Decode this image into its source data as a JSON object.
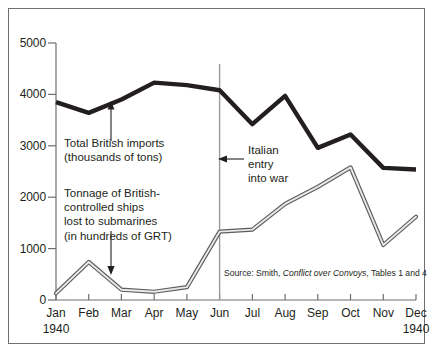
{
  "chart_data": {
    "type": "line",
    "title": "",
    "subtitle": "",
    "xlabel": "",
    "ylabel": "",
    "grid": false,
    "legend_position": "inline-annotations",
    "categories": [
      "Jan",
      "Feb",
      "Mar",
      "Apr",
      "May",
      "Jun",
      "Jul",
      "Aug",
      "Sep",
      "Oct",
      "Nov",
      "Dec"
    ],
    "x_axis_sub_start": "1940",
    "x_axis_sub_end": "1940",
    "ylim": [
      0,
      5000
    ],
    "yticks": [
      0,
      1000,
      2000,
      3000,
      4000,
      5000
    ],
    "ytick_labels": [
      "0",
      "1000",
      "2000",
      "3000",
      "4000",
      "5000"
    ],
    "series": [
      {
        "name": "Total British imports (thousands of tons)",
        "color": "#231f20",
        "style": "thick-solid",
        "values": [
          3850,
          3640,
          3900,
          4230,
          4180,
          4080,
          3420,
          3970,
          2960,
          3220,
          2570,
          2540
        ]
      },
      {
        "name": "Tonnage of British-controlled ships lost to submarines (in hundreds of GRT)",
        "color": "#8c8c8c",
        "style": "double-stroke",
        "values": [
          130,
          740,
          200,
          160,
          250,
          1330,
          1370,
          1870,
          2200,
          2580,
          1070,
          1620
        ]
      }
    ],
    "annotations": [
      {
        "name": "imports-label",
        "text": "Total British imports\n(thousands of tons)",
        "arrow": "up",
        "points_to_month": "Mar"
      },
      {
        "name": "losses-label",
        "text": "Tonnage of British-\ncontrolled ships\nlost to submarines\n(in hundreds of GRT)",
        "arrow": "down",
        "points_to_month": "Mar"
      },
      {
        "name": "italian-entry-label",
        "text": "Italian\nentry\ninto war",
        "arrow": "left",
        "points_to_month": "Jun"
      }
    ],
    "event_line": {
      "label": "Italian entry into war",
      "month": "Jun",
      "color": "#9a9a9a"
    },
    "source": {
      "prefix": "Source:  Smith, ",
      "italic_title": "Conflict over Convoys",
      "suffix": ", Tables 1 and 4"
    }
  }
}
